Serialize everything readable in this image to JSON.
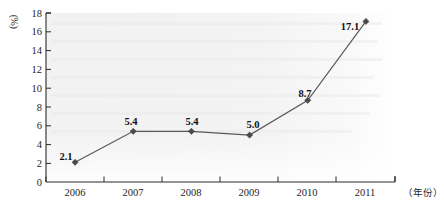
{
  "chart_data": {
    "type": "line",
    "title": "",
    "subtitle": "",
    "xlabel": "（年份）",
    "ylabel": "(%)",
    "categories": [
      "2006",
      "2007",
      "2008",
      "2009",
      "2010",
      "2011"
    ],
    "x": [
      2006,
      2007,
      2008,
      2009,
      2010,
      2011
    ],
    "values": [
      2.1,
      5.4,
      5.4,
      5.0,
      8.7,
      17.1
    ],
    "point_labels": [
      "2.1",
      "5.4",
      "5.4",
      "5.0",
      "8.7",
      "17.1"
    ],
    "series": [
      {
        "name": "",
        "values": [
          2.1,
          5.4,
          5.4,
          5.0,
          8.7,
          17.1
        ],
        "marker": "diamond",
        "line_color": "#595959",
        "marker_color": "#4a4a4a"
      }
    ],
    "ylim": [
      0,
      18
    ],
    "ytick_step": 2,
    "ytick_labels": [
      "0",
      "2",
      "4",
      "6",
      "8",
      "10",
      "12",
      "14",
      "16",
      "18"
    ],
    "ytick_values": [
      0,
      2,
      4,
      6,
      8,
      10,
      12,
      14,
      16,
      18
    ],
    "xtick_labels": [
      "2006",
      "2007",
      "2008",
      "2009",
      "2010",
      "2011"
    ],
    "grid": false,
    "legend": null,
    "legend_position": "none",
    "annotations": [],
    "plot_background": "#f4f4f4",
    "axis_color": "#2b2b2b"
  },
  "axis_labels": {
    "y_unit": "(%)",
    "x_unit": "（年份）"
  }
}
